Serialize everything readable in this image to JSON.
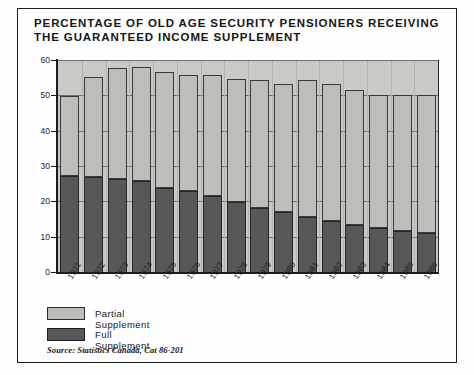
{
  "figure": {
    "title": "PERCENTAGE OF OLD AGE SECURITY PENSIONERS RECEIVING\nTHE GUARANTEED INCOME SUPPLEMENT",
    "source": "Source: Statistics Canada, Cat 86-201"
  },
  "legend": {
    "items": [
      {
        "label": "Partial Supplement",
        "color": "#bdbdba",
        "swatch": "partial-supplement-swatch"
      },
      {
        "label": "Full Supplement",
        "color": "#585858",
        "swatch": "full-supplement-swatch"
      }
    ]
  },
  "colors": {
    "partial": "#bdbdba",
    "full": "#585858",
    "plot_background": "#c9c9c6",
    "axis": "#1c1c1c",
    "frame": "#1c1c1c"
  },
  "chart_data": {
    "type": "bar",
    "subtype": "stacked-vertical",
    "title": "PERCENTAGE OF OLD AGE SECURITY PENSIONERS RECEIVING THE GUARANTEED INCOME SUPPLEMENT",
    "xlabel": "",
    "ylabel": "",
    "ylim": [
      0,
      60
    ],
    "yticks": [
      0,
      10,
      20,
      30,
      40,
      50,
      60
    ],
    "ytick_labels": [
      "0",
      "10",
      "20",
      "30",
      "40",
      "50",
      "60"
    ],
    "grid": true,
    "grid_axis": "y",
    "legend_position": "below-plot-left",
    "categories": [
      "1971",
      "1972",
      "1973",
      "1974",
      "1975",
      "1976",
      "1977",
      "1978",
      "1979",
      "1980",
      "1981",
      "1982",
      "1983",
      "1984",
      "1985",
      "1986"
    ],
    "series": [
      {
        "name": "Full Supplement",
        "color": "#585858",
        "values": [
          27.5,
          27.3,
          26.7,
          26.0,
          24.2,
          23.3,
          21.7,
          20.2,
          18.5,
          17.2,
          15.8,
          14.8,
          13.7,
          12.8,
          12.0,
          11.3
        ]
      },
      {
        "name": "Partial Supplement",
        "color": "#bdbdba",
        "values": [
          22.5,
          28.2,
          31.3,
          32.3,
          32.8,
          32.7,
          34.3,
          34.8,
          36.0,
          36.3,
          38.9,
          38.7,
          38.0,
          37.5,
          38.4,
          39.2
        ]
      }
    ],
    "totals": [
      50.0,
      55.5,
      58.0,
      58.3,
      57.0,
      56.0,
      56.0,
      55.0,
      54.5,
      53.5,
      54.7,
      53.5,
      51.7,
      50.3,
      50.4,
      50.5
    ]
  }
}
